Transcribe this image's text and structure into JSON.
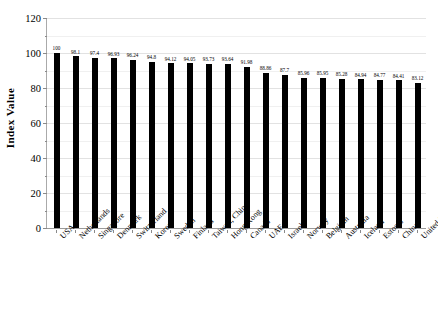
{
  "chart_data": {
    "type": "bar",
    "title": "",
    "xlabel": "",
    "ylabel": "Index Value",
    "ylim": [
      0,
      120
    ],
    "ytick_step": 20,
    "yticks": [
      0,
      20,
      40,
      60,
      80,
      100,
      120
    ],
    "grid": true,
    "legend": null,
    "bar_color": "#000000",
    "show_data_labels": true,
    "categories": [
      "USA",
      "Netherlands",
      "Singapore",
      "Denmark",
      "Switzerland",
      "Korea",
      "Sweden",
      "Finland",
      "Taiwan, China",
      "Hong Kong",
      "Canada",
      "UAE",
      "Israel",
      "Norway",
      "Belgium",
      "Australia",
      "Iceland",
      "Estonia",
      "China",
      "United Kingdom"
    ],
    "values": [
      100,
      98.1,
      97.4,
      96.93,
      96.24,
      94.8,
      94.12,
      94.05,
      93.73,
      93.64,
      91.98,
      88.86,
      87.7,
      85.96,
      85.95,
      85.28,
      84.94,
      84.77,
      84.41,
      83.12
    ],
    "value_labels": [
      "100",
      "98.1",
      "97.4",
      "96.93",
      "96.24",
      "94.8",
      "94.12",
      "94.05",
      "93.73",
      "93.64",
      "91.98",
      "88.86",
      "87.7",
      "85.96",
      "85.95",
      "85.28",
      "84.94",
      "84.77",
      "84.41",
      "83.12"
    ]
  }
}
